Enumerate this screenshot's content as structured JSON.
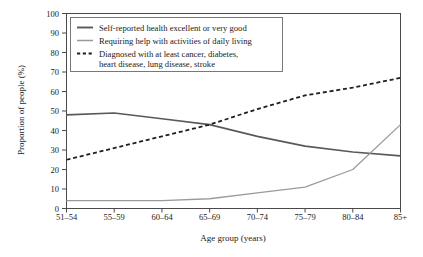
{
  "chart_data": {
    "type": "line",
    "title": "",
    "xlabel": "Age group (years)",
    "ylabel": "Proportion of people (%)",
    "categories": [
      "51–54",
      "55–59",
      "60–64",
      "65–69",
      "70–74",
      "75–79",
      "80–84",
      "85+"
    ],
    "x": [
      0,
      1,
      2,
      3,
      4,
      5,
      6,
      7
    ],
    "ylim": [
      0,
      100
    ],
    "yticks": [
      0,
      10,
      20,
      30,
      40,
      50,
      60,
      70,
      80,
      90,
      100
    ],
    "ytick_labels": [
      "0",
      "10",
      "20",
      "30",
      "40",
      "50",
      "60",
      "70",
      "80",
      "90",
      "100"
    ],
    "grid": false,
    "legend_position": "upper-left-inside",
    "series": [
      {
        "name": "Self-reported health excellent or very good",
        "style": "solid",
        "color": "#595959",
        "width": 1.6,
        "values": [
          48,
          49,
          46,
          43,
          37,
          32,
          29,
          27
        ]
      },
      {
        "name": "Requiring help with activities of daily living",
        "style": "solid",
        "color": "#9a9a9a",
        "width": 1.3,
        "values": [
          4,
          4,
          4,
          5,
          8,
          11,
          20,
          43
        ]
      },
      {
        "name": "Diagnosed with at least cancer, diabetes, heart disease, lung disease, stroke",
        "style": "dashed",
        "color": "#1f1f1f",
        "width": 1.8,
        "values": [
          25,
          31,
          37,
          43,
          51,
          58,
          62,
          67
        ]
      }
    ]
  },
  "legend": {
    "entries": [
      {
        "label_line1": "Self-reported health excellent or very good",
        "label_line2": ""
      },
      {
        "label_line1": "Requiring help with activities of daily living",
        "label_line2": ""
      },
      {
        "label_line1": "Diagnosed with at least cancer, diabetes,",
        "label_line2": "heart disease, lung disease, stroke"
      }
    ]
  },
  "colors": {
    "background": "#ffffff",
    "axis": "#4a4a4a",
    "text": "#1a1a1a",
    "series_dark_solid": "#595959",
    "series_light_solid": "#9a9a9a",
    "series_dashed": "#1f1f1f"
  }
}
